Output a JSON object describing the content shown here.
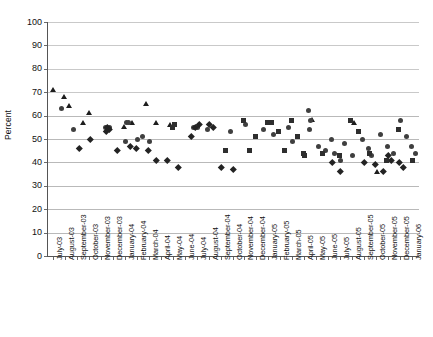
{
  "chart_data": {
    "type": "scatter",
    "title": "",
    "title_remnant": "",
    "xlabel": "",
    "ylabel": "Percent",
    "ylim": [
      0,
      100
    ],
    "ytick_step": 10,
    "yticks": [
      0,
      10,
      20,
      30,
      40,
      50,
      60,
      70,
      80,
      90,
      100
    ],
    "grid": true,
    "legend": "none",
    "categories": [
      "July-03",
      "August-03",
      "September-03",
      "October-03",
      "November-03",
      "December-03",
      "January-04",
      "February-04",
      "March-04",
      "April-04",
      "May-04",
      "June-04",
      "July-04",
      "August-04",
      "September-04",
      "October-04",
      "November-04",
      "December-04",
      "January-05",
      "February-05",
      "March-05",
      "April-05",
      "May-05",
      "June-05",
      "July-05",
      "August-05",
      "September-05",
      "October-05",
      "November-05",
      "December-05",
      "January-06"
    ],
    "series": [
      {
        "name": "triangle-series",
        "marker": "triangle",
        "points": [
          {
            "x": 0.05,
            "y": 71
          },
          {
            "x": 0.95,
            "y": 68
          },
          {
            "x": 1.35,
            "y": 64
          },
          {
            "x": 3.05,
            "y": 61
          },
          {
            "x": 2.55,
            "y": 57
          },
          {
            "x": 7.75,
            "y": 65
          },
          {
            "x": 6.65,
            "y": 57
          },
          {
            "x": 8.65,
            "y": 57
          },
          {
            "x": 9.75,
            "y": 56
          },
          {
            "x": 5.95,
            "y": 55
          },
          {
            "x": 21.65,
            "y": 58
          },
          {
            "x": 25.15,
            "y": 57
          },
          {
            "x": 27.05,
            "y": 36
          }
        ]
      },
      {
        "name": "circle-series",
        "marker": "circle",
        "points": [
          {
            "x": 0.75,
            "y": 63
          },
          {
            "x": 1.75,
            "y": 54
          },
          {
            "x": 4.35,
            "y": 55
          },
          {
            "x": 4.55,
            "y": 54
          },
          {
            "x": 4.75,
            "y": 55
          },
          {
            "x": 6.15,
            "y": 57
          },
          {
            "x": 6.35,
            "y": 57
          },
          {
            "x": 7.05,
            "y": 50
          },
          {
            "x": 7.45,
            "y": 51
          },
          {
            "x": 8.05,
            "y": 49
          },
          {
            "x": 6.05,
            "y": 49
          },
          {
            "x": 11.75,
            "y": 55
          },
          {
            "x": 12.05,
            "y": 55
          },
          {
            "x": 12.95,
            "y": 54
          },
          {
            "x": 14.85,
            "y": 53
          },
          {
            "x": 16.05,
            "y": 56
          },
          {
            "x": 17.55,
            "y": 54
          },
          {
            "x": 18.45,
            "y": 52
          },
          {
            "x": 19.65,
            "y": 55
          },
          {
            "x": 20.05,
            "y": 49
          },
          {
            "x": 21.35,
            "y": 62
          },
          {
            "x": 21.55,
            "y": 58
          },
          {
            "x": 21.45,
            "y": 54
          },
          {
            "x": 22.15,
            "y": 47
          },
          {
            "x": 22.75,
            "y": 45
          },
          {
            "x": 23.25,
            "y": 50
          },
          {
            "x": 23.55,
            "y": 44
          },
          {
            "x": 24.05,
            "y": 41
          },
          {
            "x": 24.35,
            "y": 48
          },
          {
            "x": 25.05,
            "y": 43
          },
          {
            "x": 25.85,
            "y": 50
          },
          {
            "x": 26.35,
            "y": 46
          },
          {
            "x": 26.65,
            "y": 43
          },
          {
            "x": 27.35,
            "y": 52
          },
          {
            "x": 27.95,
            "y": 47
          },
          {
            "x": 28.45,
            "y": 44
          },
          {
            "x": 29.05,
            "y": 58
          },
          {
            "x": 29.55,
            "y": 51
          },
          {
            "x": 29.95,
            "y": 47
          },
          {
            "x": 30.25,
            "y": 44
          }
        ]
      },
      {
        "name": "diamond-square-series",
        "marker": "diamond",
        "points": [
          {
            "x": 3.15,
            "y": 50
          },
          {
            "x": 2.25,
            "y": 46
          },
          {
            "x": 4.55,
            "y": 55
          },
          {
            "x": 4.75,
            "y": 54
          },
          {
            "x": 4.45,
            "y": 53
          },
          {
            "x": 5.35,
            "y": 45
          },
          {
            "x": 6.45,
            "y": 47
          },
          {
            "x": 6.95,
            "y": 46
          },
          {
            "x": 7.95,
            "y": 45
          },
          {
            "x": 8.65,
            "y": 41
          },
          {
            "x": 9.55,
            "y": 41
          },
          {
            "x": 10.45,
            "y": 38
          },
          {
            "x": 11.55,
            "y": 51
          },
          {
            "x": 11.95,
            "y": 55
          },
          {
            "x": 12.25,
            "y": 56
          },
          {
            "x": 13.05,
            "y": 56
          },
          {
            "x": 13.45,
            "y": 55
          },
          {
            "x": 14.05,
            "y": 38
          },
          {
            "x": 15.05,
            "y": 37
          },
          {
            "x": 23.35,
            "y": 40
          },
          {
            "x": 24.05,
            "y": 36
          },
          {
            "x": 26.05,
            "y": 40
          },
          {
            "x": 26.95,
            "y": 39
          },
          {
            "x": 27.65,
            "y": 36
          },
          {
            "x": 28.05,
            "y": 43
          },
          {
            "x": 28.25,
            "y": 41
          },
          {
            "x": 28.95,
            "y": 40
          },
          {
            "x": 29.25,
            "y": 38
          }
        ]
      },
      {
        "name": "square-series",
        "marker": "square",
        "points": [
          {
            "x": 15.95,
            "y": 58
          },
          {
            "x": 16.95,
            "y": 51
          },
          {
            "x": 16.45,
            "y": 45
          },
          {
            "x": 17.95,
            "y": 57
          },
          {
            "x": 18.25,
            "y": 57
          },
          {
            "x": 18.85,
            "y": 53
          },
          {
            "x": 19.35,
            "y": 45
          },
          {
            "x": 19.95,
            "y": 58
          },
          {
            "x": 20.45,
            "y": 51
          },
          {
            "x": 20.95,
            "y": 44
          },
          {
            "x": 21.05,
            "y": 43
          },
          {
            "x": 22.55,
            "y": 44
          },
          {
            "x": 23.95,
            "y": 43
          },
          {
            "x": 24.85,
            "y": 58
          },
          {
            "x": 25.55,
            "y": 53
          },
          {
            "x": 26.45,
            "y": 44
          },
          {
            "x": 27.85,
            "y": 41
          },
          {
            "x": 28.85,
            "y": 54
          },
          {
            "x": 30.05,
            "y": 41
          },
          {
            "x": 14.45,
            "y": 45
          },
          {
            "x": 9.95,
            "y": 55
          },
          {
            "x": 10.15,
            "y": 56
          }
        ]
      }
    ]
  }
}
